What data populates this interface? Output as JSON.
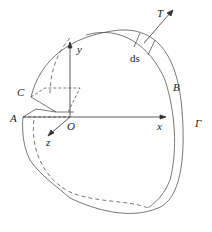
{
  "diagram": {
    "labels": {
      "T": "T",
      "ds": "ds",
      "B": "B",
      "C": "C",
      "A": "A",
      "O": "O",
      "x": "x",
      "y": "y",
      "z": "z",
      "Gamma": "Γ"
    },
    "colors": {
      "line": "#555555",
      "text": "#222222",
      "background": "#ffffff"
    }
  }
}
